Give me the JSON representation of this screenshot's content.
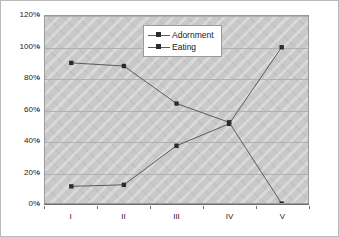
{
  "chart_data": {
    "type": "line",
    "title": "",
    "xlabel": "",
    "ylabel": "",
    "categories": [
      "I",
      "II",
      "III",
      "IV",
      "V"
    ],
    "series": [
      {
        "name": "Adornment",
        "marker": "square",
        "color": "#2b2b2b",
        "values": [
          11,
          12,
          37,
          51,
          100
        ]
      },
      {
        "name": "Eating",
        "marker": "square",
        "color": "#2b2b2b",
        "values": [
          90,
          88,
          64,
          52,
          0
        ]
      }
    ],
    "ylim": [
      0,
      120
    ],
    "ytick_values": [
      0,
      20,
      40,
      60,
      80,
      100,
      120
    ],
    "ytick_labels": [
      "0%",
      "20%",
      "40%",
      "60%",
      "80%",
      "100%",
      "120%"
    ],
    "grid": true,
    "legend_position": "top-center",
    "plot_background": "#c9c9c9",
    "gridline_color": "#b0b0b0",
    "axis_color": "#6e6e6e",
    "line_color": "#5a5a5a"
  },
  "legend": {
    "items": [
      {
        "label": "Adornment"
      },
      {
        "label": "Eating"
      }
    ]
  }
}
